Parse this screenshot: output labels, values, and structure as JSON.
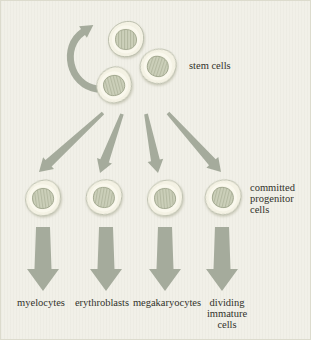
{
  "diagram": {
    "labels": {
      "stem_cells": "stem cells",
      "progenitor_lines": [
        "committed",
        "progenitor",
        "cells"
      ],
      "lineages": [
        {
          "lines": [
            "myelocytes"
          ]
        },
        {
          "lines": [
            "erythroblasts"
          ]
        },
        {
          "lines": [
            "megakaryocytes"
          ]
        },
        {
          "lines": [
            "dividing",
            "immature",
            "cells"
          ]
        }
      ]
    },
    "colors": {
      "background": "#f1f0e8",
      "arrow": "#a5ab9c",
      "cell_body": "#f4f2e4",
      "cell_outline": "#b9bcaa",
      "nucleus": "#ccd0ba",
      "nucleus_hatch": "#b5baa2",
      "nucleus_outline": "#9aa188",
      "text": "#32322b"
    }
  }
}
